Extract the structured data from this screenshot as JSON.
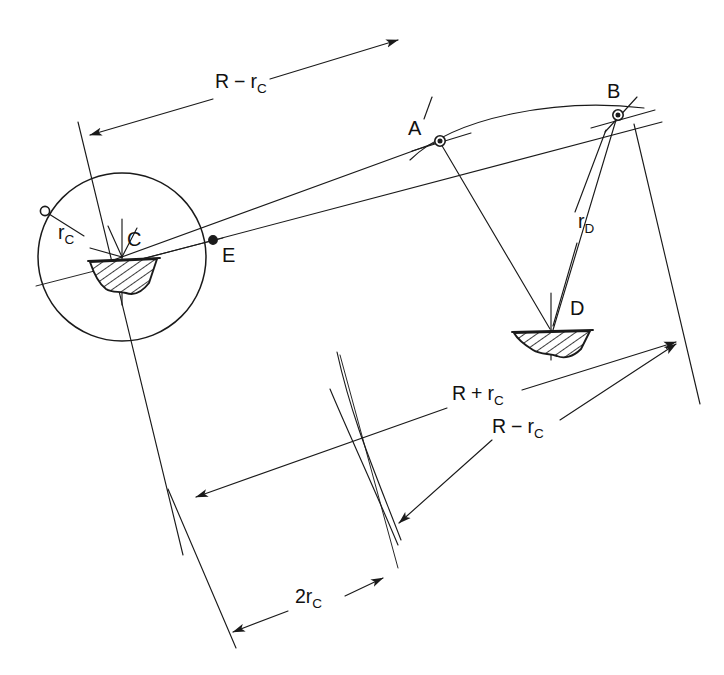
{
  "figure": {
    "background": "#ffffff",
    "ink": "#1a1a1a",
    "width": 724,
    "height": 675
  },
  "labels": {
    "point_a": "A",
    "point_b": "B",
    "point_c": "C",
    "point_d": "D",
    "point_e": "E"
  },
  "dimensions": [
    {
      "id": "r-minus-rc-top",
      "base": "R",
      "operator": "−",
      "term": "r",
      "subscript": "C",
      "text": "R − r_C",
      "x": 215,
      "y": 88,
      "arrows": "both"
    },
    {
      "id": "r-plus-rc-right",
      "base": "R",
      "operator": "+",
      "term": "r",
      "subscript": "C",
      "text": "R + r_C",
      "x": 452,
      "y": 400,
      "arrows": "both"
    },
    {
      "id": "r-minus-rc-right",
      "base": "R",
      "operator": "−",
      "term": "r",
      "subscript": "C",
      "text": "R − r_C",
      "x": 492,
      "y": 433,
      "arrows": "single"
    },
    {
      "id": "two-rc-bottom",
      "base": "2r",
      "operator": "",
      "term": "",
      "subscript": "C",
      "text": "2r_C",
      "x": 295,
      "y": 603,
      "arrows": "both"
    }
  ],
  "radii": [
    {
      "id": "rc-circle",
      "base": "r",
      "subscript": "C",
      "text": "r_C",
      "x": 58,
      "y": 239,
      "description": "radius of the circle centred on C"
    },
    {
      "id": "rd-leader",
      "base": "r",
      "subscript": "D",
      "text": "r_D",
      "x": 578,
      "y": 228,
      "description": "radius leader from B down to D"
    }
  ],
  "geometry": {
    "circle_c": {
      "cx": 122,
      "cy": 257,
      "r": 84
    },
    "station_c": {
      "x": 122,
      "y": 257
    },
    "station_d": {
      "x": 551,
      "y": 330
    },
    "point_a": {
      "x": 440,
      "y": 141
    },
    "point_b": {
      "x": 618,
      "y": 115
    },
    "point_e": {
      "x": 213,
      "y": 240
    },
    "markers": {
      "a_style": "open-circle-crossed",
      "b_style": "open-circle-crossed",
      "e_style": "filled-dot",
      "rc_anchor_style": "open-circle-small"
    }
  },
  "hatched_shapes": [
    {
      "id": "hull-c",
      "at": "C",
      "kind": "ship-hull-section",
      "x": 122,
      "y": 257
    },
    {
      "id": "hull-d",
      "at": "D",
      "kind": "ship-hull-section",
      "x": 551,
      "y": 330
    }
  ]
}
